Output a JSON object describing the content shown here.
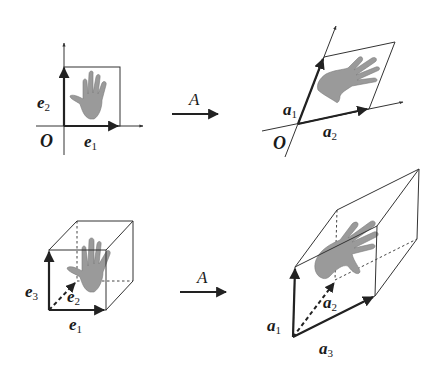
{
  "figure": {
    "panels": [
      {
        "id": "2d-original",
        "type": "unit-square",
        "origin_label": "O",
        "vectors": [
          {
            "name": "e",
            "sub": "1"
          },
          {
            "name": "e",
            "sub": "2"
          }
        ]
      },
      {
        "id": "2d-transformed",
        "type": "parallelogram",
        "origin_label": "O",
        "vectors": [
          {
            "name": "a",
            "sub": "1"
          },
          {
            "name": "a",
            "sub": "2"
          }
        ]
      },
      {
        "id": "3d-original",
        "type": "unit-cube",
        "vectors": [
          {
            "name": "e",
            "sub": "1"
          },
          {
            "name": "e",
            "sub": "2"
          },
          {
            "name": "e",
            "sub": "3"
          }
        ]
      },
      {
        "id": "3d-transformed",
        "type": "parallelepiped",
        "vectors": [
          {
            "name": "a",
            "sub": "1"
          },
          {
            "name": "a",
            "sub": "2"
          },
          {
            "name": "a",
            "sub": "3"
          }
        ]
      }
    ],
    "maps": [
      {
        "label": "A"
      },
      {
        "label": "A"
      }
    ],
    "colors": {
      "ink": "#222222",
      "hand": "#9a9a9a",
      "background": "#ffffff"
    }
  }
}
